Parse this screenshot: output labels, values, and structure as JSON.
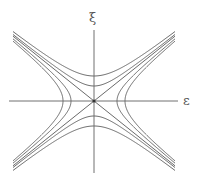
{
  "diagram": {
    "labels": {
      "vertical_axis": "ξ",
      "horizontal_axis": "ε"
    },
    "origin": {
      "x": 94,
      "y": 101
    },
    "axes": {
      "horizontal": {
        "x1": 9,
        "x2": 178
      },
      "vertical": {
        "y1": 30,
        "y2": 173
      }
    },
    "asymptote_slope": 0.8,
    "extent_dx": 81,
    "horizontal_opening_hyperbolas": [
      {
        "a": 23
      },
      {
        "a": 31
      }
    ],
    "vertical_opening_hyperbolas": [
      {
        "b": 15
      },
      {
        "b": 25
      }
    ],
    "colors": {
      "line": "#6a6a6a",
      "axis": "#707070",
      "background": "#ffffff"
    }
  }
}
